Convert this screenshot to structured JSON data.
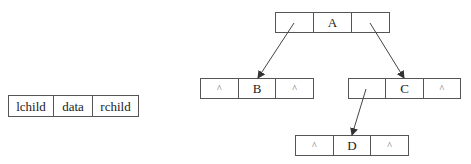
{
  "legend": {
    "fields": [
      "lchild",
      "data",
      "rchild"
    ]
  },
  "nodes": [
    {
      "id": "A",
      "lchild": "",
      "data": "A",
      "rchild": ""
    },
    {
      "id": "B",
      "lchild": "^",
      "data": "B",
      "rchild": "^"
    },
    {
      "id": "C",
      "lchild": "",
      "data": "C",
      "rchild": "^"
    },
    {
      "id": "D",
      "lchild": "^",
      "data": "D",
      "rchild": "^"
    }
  ],
  "edges": [
    {
      "from": "A",
      "slot": "lchild",
      "to": "B"
    },
    {
      "from": "A",
      "slot": "rchild",
      "to": "C"
    },
    {
      "from": "C",
      "slot": "lchild",
      "to": "D"
    }
  ],
  "colors": {
    "border": "#555555",
    "arrow": "#444444",
    "background": "#ffffff"
  }
}
